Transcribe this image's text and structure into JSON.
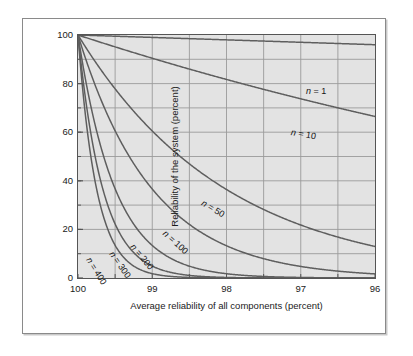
{
  "chart_data": {
    "type": "line",
    "title": "",
    "xlabel": "Average reliability of all components (percent)",
    "ylabel": "Reliability of the system (percent)",
    "xlim": [
      100,
      96
    ],
    "ylim": [
      0,
      100
    ],
    "x_ticks": [
      "100",
      "99",
      "98",
      "97",
      "96"
    ],
    "x_tick_values": [
      100,
      99,
      98,
      97,
      96
    ],
    "y_ticks": [
      "0",
      "20",
      "40",
      "60",
      "80",
      "100"
    ],
    "y_tick_values": [
      0,
      20,
      40,
      60,
      80,
      100
    ],
    "grid": true,
    "grid_x_step": 0.5,
    "grid_y_step": 10,
    "legend": "inline-curve-labels",
    "formula": "R = r^n",
    "series": [
      {
        "name": "n = 1",
        "n": 1,
        "label": "n = 1",
        "x": [
          100,
          99.5,
          99,
          98.5,
          98,
          97.5,
          97,
          96.5,
          96
        ],
        "values": [
          100,
          99.5,
          99,
          98.5,
          98,
          97.5,
          97,
          96.5,
          96
        ]
      },
      {
        "name": "n = 10",
        "n": 10,
        "label": "n = 10",
        "x": [
          100,
          99.5,
          99,
          98.5,
          98,
          97.5,
          97,
          96.5,
          96
        ],
        "values": [
          100,
          95.1,
          90.4,
          86.0,
          81.7,
          77.6,
          73.7,
          70.0,
          66.5
        ]
      },
      {
        "name": "n = 50",
        "n": 50,
        "label": "n = 50",
        "x": [
          100,
          99.5,
          99,
          98.5,
          98,
          97.5,
          97,
          96.5,
          96
        ],
        "values": [
          100,
          77.8,
          60.5,
          47.0,
          36.4,
          28.2,
          21.8,
          16.8,
          13.0
        ]
      },
      {
        "name": "n = 100",
        "n": 100,
        "label": "n = 100",
        "x": [
          100,
          99.5,
          99,
          98.5,
          98,
          97.5,
          97,
          96.5,
          96
        ],
        "values": [
          100,
          60.6,
          36.6,
          22.1,
          13.3,
          8.0,
          4.8,
          2.8,
          1.7
        ]
      },
      {
        "name": "n = 200",
        "n": 200,
        "label": "n = 200",
        "x": [
          100,
          99.5,
          99,
          98.5,
          98,
          97.5,
          97,
          96.5,
          96
        ],
        "values": [
          100,
          36.7,
          13.4,
          4.9,
          1.8,
          0.6,
          0.2,
          0.1,
          0.0
        ]
      },
      {
        "name": "n = 300",
        "n": 300,
        "label": "n = 300",
        "x": [
          100,
          99.5,
          99,
          98.5,
          98,
          97.5,
          97,
          96.5,
          96
        ],
        "values": [
          100,
          22.2,
          4.9,
          1.1,
          0.2,
          0.05,
          0.01,
          0.0,
          0.0
        ]
      },
      {
        "name": "n = 400",
        "n": 400,
        "label": "n = 400",
        "x": [
          100,
          99.5,
          99,
          98.5,
          98,
          97.5,
          97,
          96.5,
          96
        ],
        "values": [
          100,
          13.4,
          1.8,
          0.24,
          0.03,
          0.0,
          0.0,
          0.0,
          0.0
        ]
      }
    ]
  },
  "colors": {
    "plot_background": "#e3e3e3",
    "page_background": "#ffffff",
    "grid": "#9a9a9a",
    "axis": "#555555",
    "curve": "#5e5e5e",
    "text": "#1a1a1a",
    "frame_border": "#8a8a8a"
  },
  "curve_labels": [
    {
      "text": "n = 1",
      "x": 228,
      "y": 52,
      "rotate": 0
    },
    {
      "text": "n = 10",
      "x": 213,
      "y": 93,
      "rotate": 10
    },
    {
      "text": "n = 50",
      "x": 124,
      "y": 163,
      "rotate": 31
    },
    {
      "text": "n = 100",
      "x": 86,
      "y": 193,
      "rotate": 42
    },
    {
      "text": "n = 200",
      "x": 54,
      "y": 206,
      "rotate": 50
    },
    {
      "text": "n = 300",
      "x": 33,
      "y": 213,
      "rotate": 55
    },
    {
      "text": "n = 400",
      "x": 10,
      "y": 219,
      "rotate": 58
    }
  ]
}
